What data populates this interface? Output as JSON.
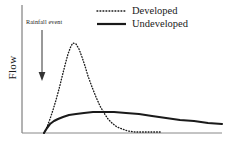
{
  "figure": {
    "background_color": "#ffffff",
    "ink_color": "#1a1a1a"
  },
  "axes": {
    "y_label": "Flow",
    "x_label": "",
    "axis_color": "#555555",
    "x_axis": {
      "x_start": 22,
      "x_end": 222,
      "y": 133
    },
    "y_axis": {
      "x": 22,
      "y_top": 5,
      "y_bottom": 133
    }
  },
  "annotation": {
    "label": "Rainfall event",
    "arrow": {
      "x": 42,
      "y_top": 30,
      "y_bottom": 80,
      "direction": "down"
    }
  },
  "legend": {
    "position": "top-right",
    "entries": [
      {
        "label": "Developed",
        "style": "dotted",
        "color": "#1a1a1a",
        "sample_x1": 97,
        "sample_x2": 126,
        "sample_y": 11
      },
      {
        "label": "Undeveloped",
        "style": "solid",
        "color": "#1a1a1a",
        "sample_x1": 97,
        "sample_x2": 126,
        "sample_y": 24
      }
    ]
  },
  "chart_data": {
    "type": "line",
    "title": "",
    "subtitle": "",
    "xlabel": "",
    "ylabel": "Flow",
    "grid": false,
    "legend_position": "top-right",
    "annotations": [
      {
        "text": "Rainfall event",
        "type": "arrow-label",
        "x": 42,
        "points_to_axis": "x"
      }
    ],
    "xlim": [
      0,
      1
    ],
    "ylim": [
      0,
      1
    ],
    "x_tick_labels": [],
    "y_tick_labels": [],
    "series": [
      {
        "name": "Developed",
        "style": "dotted",
        "color": "#1a1a1a",
        "description": "Sharp high peak shortly after rainfall event, rapid recession to baseline",
        "points": [
          [
            44,
            133
          ],
          [
            47,
            127
          ],
          [
            50,
            119
          ],
          [
            53,
            110
          ],
          [
            56,
            100
          ],
          [
            59,
            89
          ],
          [
            62,
            77
          ],
          [
            65,
            65
          ],
          [
            68,
            54
          ],
          [
            71,
            46
          ],
          [
            73,
            43
          ],
          [
            76,
            44
          ],
          [
            79,
            49
          ],
          [
            82,
            57
          ],
          [
            85,
            66
          ],
          [
            88,
            76
          ],
          [
            92,
            87
          ],
          [
            96,
            97
          ],
          [
            100,
            106
          ],
          [
            104,
            113
          ],
          [
            108,
            119
          ],
          [
            112,
            123
          ],
          [
            117,
            127
          ],
          [
            122,
            129
          ],
          [
            128,
            131
          ],
          [
            135,
            132
          ],
          [
            143,
            132
          ],
          [
            152,
            132
          ],
          [
            162,
            132
          ]
        ]
      },
      {
        "name": "Undeveloped",
        "style": "solid",
        "color": "#1a1a1a",
        "description": "Low broad plateau with slow gradual recession extending to end of record",
        "points": [
          [
            44,
            133
          ],
          [
            47,
            128
          ],
          [
            50,
            124
          ],
          [
            54,
            121
          ],
          [
            58,
            119
          ],
          [
            63,
            117
          ],
          [
            69,
            115
          ],
          [
            76,
            114
          ],
          [
            84,
            113
          ],
          [
            93,
            112
          ],
          [
            103,
            112
          ],
          [
            114,
            112
          ],
          [
            126,
            113
          ],
          [
            139,
            114
          ],
          [
            152,
            116
          ],
          [
            166,
            118
          ],
          [
            180,
            120
          ],
          [
            194,
            121
          ],
          [
            208,
            123
          ],
          [
            222,
            124
          ]
        ]
      }
    ]
  }
}
